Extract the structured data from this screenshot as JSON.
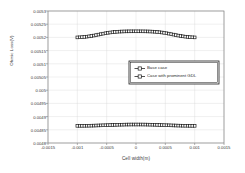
{
  "chart_data": {
    "type": "line",
    "title": "",
    "xlabel": "Cell width(m)",
    "ylabel": "Ohmic Loss(V)",
    "xlim": [
      -0.0015,
      0.0015
    ],
    "ylim": [
      0.0048,
      0.0053
    ],
    "grid": true,
    "legend_position": "center-right",
    "xticks": [
      "-0.0015",
      "-0.001",
      "-0.0005",
      "0",
      "0.0005",
      "0.001",
      "0.0015"
    ],
    "xtick_values": [
      -0.0015,
      -0.001,
      -0.0005,
      0,
      0.0005,
      0.001,
      0.0015
    ],
    "yticks": [
      "0.0053",
      "0.00525",
      "0.0052",
      "0.00515",
      "0.0051",
      "0.00505",
      "0.005",
      "0.00495",
      "0.0049",
      "0.00485",
      "0.0048"
    ],
    "ytick_values": [
      0.0053,
      0.00525,
      0.0052,
      0.00515,
      0.0051,
      0.00505,
      0.005,
      0.00495,
      0.0049,
      0.00485,
      0.0048
    ],
    "marker": "square",
    "x": [
      -0.001,
      -0.00096,
      -0.00092,
      -0.00088,
      -0.00084,
      -0.0008,
      -0.00076,
      -0.00072,
      -0.00068,
      -0.00064,
      -0.0006,
      -0.00056,
      -0.00052,
      -0.00048,
      -0.00044,
      -0.0004,
      -0.00036,
      -0.00032,
      -0.00028,
      -0.00024,
      -0.0002,
      -0.00016,
      -0.00012,
      -8e-05,
      -4e-05,
      0.0,
      4e-05,
      8e-05,
      0.00012,
      0.00016,
      0.0002,
      0.00024,
      0.00028,
      0.00032,
      0.00036,
      0.0004,
      0.00044,
      0.00048,
      0.00052,
      0.00056,
      0.0006,
      0.00064,
      0.00068,
      0.00072,
      0.00076,
      0.0008,
      0.00084,
      0.00088,
      0.00092,
      0.00096,
      0.001
    ],
    "series": [
      {
        "name": "Base case",
        "values": [
          0.0052,
          0.0052004,
          0.005201,
          0.0052018,
          0.0052028,
          0.005204,
          0.0052054,
          0.005207,
          0.0052088,
          0.0052106,
          0.0052124,
          0.0052142,
          0.0052158,
          0.0052173,
          0.0052186,
          0.0052197,
          0.0052206,
          0.0052213,
          0.0052219,
          0.0052223,
          0.0052226,
          0.0052228,
          0.0052229,
          0.005223,
          0.005223,
          0.005223,
          0.005223,
          0.005223,
          0.0052229,
          0.0052228,
          0.0052226,
          0.0052223,
          0.0052219,
          0.0052213,
          0.0052206,
          0.0052197,
          0.0052186,
          0.0052173,
          0.0052158,
          0.0052142,
          0.0052124,
          0.0052106,
          0.0052088,
          0.005207,
          0.0052054,
          0.005204,
          0.0052028,
          0.0052018,
          0.005201,
          0.0052004,
          0.0052
        ]
      },
      {
        "name": "Case with prominent GDL",
        "values": [
          0.004865,
          0.004865,
          0.0048651,
          0.0048652,
          0.0048653,
          0.0048655,
          0.0048657,
          0.0048659,
          0.0048662,
          0.0048665,
          0.0048668,
          0.0048671,
          0.0048674,
          0.0048677,
          0.004868,
          0.0048683,
          0.0048686,
          0.0048689,
          0.0048692,
          0.0048694,
          0.0048696,
          0.0048698,
          0.0048699,
          0.00487,
          0.00487,
          0.00487,
          0.00487,
          0.00487,
          0.0048699,
          0.0048698,
          0.0048696,
          0.0048694,
          0.0048692,
          0.0048689,
          0.0048686,
          0.0048683,
          0.004868,
          0.0048677,
          0.0048674,
          0.0048671,
          0.0048668,
          0.0048665,
          0.0048662,
          0.0048659,
          0.0048657,
          0.0048655,
          0.0048653,
          0.0048652,
          0.0048651,
          0.004865,
          0.004865
        ]
      }
    ],
    "colors": {
      "series_line": "#1a1a1a",
      "marker_face": "#ffffff",
      "axis": "#808080",
      "grid": "#d9d9d9",
      "text": "#3a3a3a"
    }
  }
}
